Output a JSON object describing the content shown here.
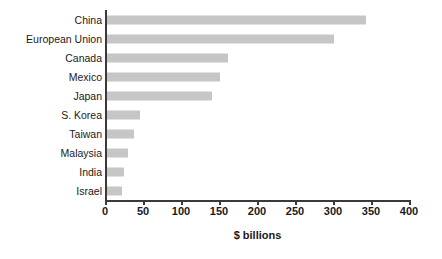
{
  "chart_data": {
    "type": "bar",
    "orientation": "horizontal",
    "title": "",
    "xlabel": "$ billions",
    "ylabel": "",
    "categories": [
      "China",
      "European Union",
      "Canada",
      "Mexico",
      "Japan",
      "S. Korea",
      "Taiwan",
      "Malaysia",
      "India",
      "Israel"
    ],
    "values": [
      341,
      299,
      159,
      149,
      138,
      44,
      35,
      27,
      23,
      20
    ],
    "xlim": [
      0,
      400
    ],
    "xticks": [
      0,
      50,
      100,
      150,
      200,
      250,
      300,
      350,
      400
    ],
    "xtick_labels": [
      "0",
      "50",
      "100",
      "150",
      "200",
      "250",
      "300",
      "350",
      "400"
    ],
    "grid": false,
    "legend": false,
    "bar_color": "#c6c6c6",
    "axis_color": "#3a3a3a",
    "background_color": "#ffffff"
  }
}
